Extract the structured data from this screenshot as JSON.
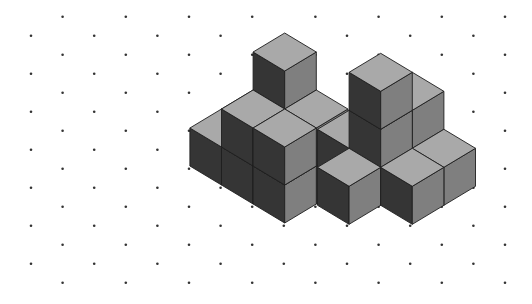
{
  "canvas": {
    "width": 532,
    "height": 304,
    "background": "#ffffff"
  },
  "grid": {
    "dot_color": "#333333",
    "dot_radius": 1.3,
    "col_spacing": 31.6,
    "row_spacing": 19,
    "x_start": 31,
    "y_start": 16.7,
    "cols": 16,
    "rows": 15
  },
  "colors": {
    "top": "#a9a9a9",
    "right": "#7f7f7f",
    "left": "#353535",
    "edge": "#1e1e1e"
  },
  "iso": {
    "w": 31.6,
    "h": 19,
    "v": 38
  },
  "figures": [
    {
      "name": "left-figure",
      "origin": [
        253.1,
        128
      ],
      "columns": [
        {
          "i": 0,
          "j": 0,
          "height": 1
        },
        {
          "i": 0,
          "j": 1,
          "height": 1
        },
        {
          "i": 1,
          "j": 0,
          "height": 3
        },
        {
          "i": 1,
          "j": 1,
          "height": 2
        },
        {
          "i": 2,
          "j": 0,
          "height": 2
        },
        {
          "i": 2,
          "j": 1,
          "height": 2
        }
      ]
    },
    {
      "name": "right-figure",
      "origin": [
        380.7,
        129.3
      ],
      "columns": [
        {
          "i": 0,
          "j": 1,
          "height": 1
        },
        {
          "i": 1,
          "j": 0,
          "height": 2
        },
        {
          "i": 1,
          "j": 1,
          "height": 3
        },
        {
          "i": 1,
          "j": 2,
          "height": 1
        },
        {
          "i": 2,
          "j": 0,
          "height": 1
        },
        {
          "i": 2,
          "j": 1,
          "height": 1
        }
      ]
    }
  ]
}
